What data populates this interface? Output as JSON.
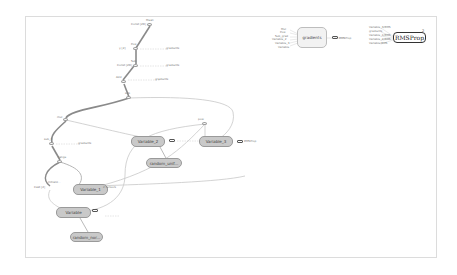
{
  "graph": {
    "nodes": {
      "mean": "Mean",
      "range": "range",
      "pow": "Pow",
      "pow_label": "pow",
      "sub": "Sub",
      "add": "Add",
      "sub_small": "sub",
      "mul": "mul",
      "sub_3": "sub_3",
      "gradients": "gradients",
      "rmsprop": "RMSProp",
      "variable_2": "Variable_2",
      "variable_3": "Variable_3",
      "variable_1": "Variable_1",
      "variable": "Variable",
      "random_uniform": "random_unif...",
      "random_normal": "random_nor..."
    },
    "side_labels": {
      "const_mean": "Const [2D]",
      "y_input": "y [2]",
      "const_pow": "Const [2D]",
      "cast": "Cast [2]",
      "gradients_link": "gradients",
      "grad_dep": "gradients",
      "grad_dep2": "gradients",
      "grad_dep3": "gradients",
      "rms_link": "RMSProp",
      "var_link": "2 tensors",
      "init_label": "Initializ..."
    },
    "gradients_inputs": [
      "Mul",
      "Pow",
      "Sub_grad",
      "Variable_2",
      "Variable_3",
      "Variable"
    ],
    "rmsprop_inputs": [
      "Variable_3/RMS",
      "gradients",
      "Variable_1/RMS",
      "Variable_2/RMS",
      "Variable/RMS"
    ],
    "rmsprop_badge": "2"
  },
  "colors": {
    "variable_fill": "#c9c9c9",
    "meta_fill": "#f2f2f2",
    "edge": "#b5b5b5",
    "edge_dark": "#8a8a8a"
  }
}
